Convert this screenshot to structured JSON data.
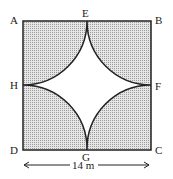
{
  "diagram": {
    "labels": {
      "A": "A",
      "B": "B",
      "C": "C",
      "D": "D",
      "E": "E",
      "F": "F",
      "G": "G",
      "H": "H"
    },
    "dimension": "14 m",
    "colors": {
      "shade": "#c8c8c8",
      "stroke": "#222222"
    }
  }
}
